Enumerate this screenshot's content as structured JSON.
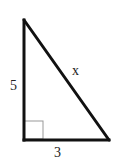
{
  "diagram": {
    "type": "right-triangle",
    "labels": {
      "vertical_leg": "5",
      "horizontal_leg": "3",
      "hypotenuse": "x"
    },
    "colors": {
      "stroke": "#111111",
      "right_angle_marker": "#999999",
      "background": "#ffffff"
    }
  }
}
